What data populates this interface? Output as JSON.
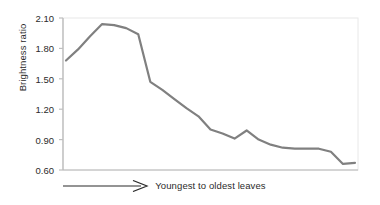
{
  "chart_data": {
    "type": "line",
    "title": "",
    "subtitle": "",
    "xlabel": "Youngest to oldest leaves",
    "ylabel": "Brightness ratio",
    "xlabel_arrow": "arrow-right",
    "ylim": [
      0.6,
      2.1
    ],
    "ytick_labels": [
      "2.10",
      "1.80",
      "1.50",
      "1.20",
      "0.90",
      "0.60"
    ],
    "ytick_values": [
      2.1,
      1.8,
      1.5,
      1.2,
      0.9,
      0.6
    ],
    "xtick_labels": [],
    "grid": false,
    "legend": null,
    "series": [
      {
        "name": "Brightness ratio",
        "color": "#808080",
        "line_width": 2.2,
        "x": [
          1,
          2,
          3,
          4,
          5,
          6,
          7,
          8,
          9,
          10,
          11,
          12,
          13,
          14,
          15,
          16,
          17,
          18,
          19,
          20,
          21,
          22,
          23,
          24,
          25
        ],
        "values": [
          1.68,
          1.79,
          1.92,
          2.04,
          2.03,
          2.0,
          1.94,
          1.47,
          1.39,
          1.3,
          1.21,
          1.13,
          1.0,
          0.96,
          0.91,
          0.99,
          0.9,
          0.85,
          0.82,
          0.81,
          0.81,
          0.81,
          0.78,
          0.66,
          0.67
        ]
      }
    ],
    "axis": {
      "left_spine": true,
      "bottom_spine": true,
      "top_spine": false,
      "right_spine": false,
      "spine_color": "#bfbfbf",
      "tick_color": "#bfbfbf",
      "plot_border_color": "#e4e4e4"
    }
  }
}
